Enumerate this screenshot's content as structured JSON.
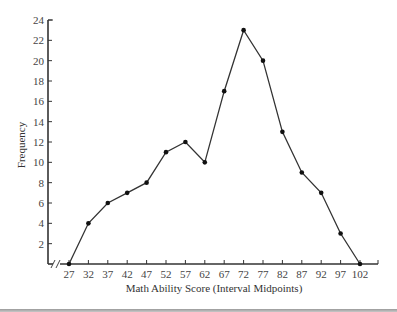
{
  "chart_data": {
    "type": "line",
    "title": "",
    "xlabel": "Math Ability Score (Interval Midpoints)",
    "ylabel": "Frequency",
    "categories": [
      27,
      32,
      37,
      42,
      47,
      52,
      57,
      62,
      67,
      72,
      77,
      82,
      87,
      92,
      97,
      102
    ],
    "x": [
      27,
      32,
      37,
      42,
      47,
      52,
      57,
      62,
      67,
      72,
      77,
      82,
      87,
      92,
      97,
      102
    ],
    "values": [
      0,
      4,
      6,
      7,
      8,
      11,
      12,
      10,
      17,
      23,
      20,
      13,
      9,
      7,
      3,
      0
    ],
    "series": [
      {
        "name": "Frequency",
        "values": [
          0,
          4,
          6,
          7,
          8,
          11,
          12,
          10,
          17,
          23,
          20,
          13,
          9,
          7,
          3,
          0
        ]
      }
    ],
    "x_tick_labels": [
      "27",
      "32",
      "37",
      "42",
      "47",
      "52",
      "57",
      "62",
      "67",
      "72",
      "77",
      "82",
      "87",
      "92",
      "97",
      "102"
    ],
    "y_tick_labels": [
      "2",
      "4",
      "6",
      "8",
      "10",
      "12",
      "14",
      "16",
      "18",
      "20",
      "22",
      "24"
    ],
    "y_ticks": [
      2,
      4,
      6,
      8,
      10,
      12,
      14,
      16,
      18,
      20,
      22,
      24
    ],
    "ylim": [
      0,
      24
    ],
    "xlim": [
      22,
      107
    ],
    "grid": false,
    "legend": null,
    "annotations": [
      "x-axis break marks (//) near origin"
    ],
    "line_color": "#333333",
    "marker_color": "#111111"
  }
}
